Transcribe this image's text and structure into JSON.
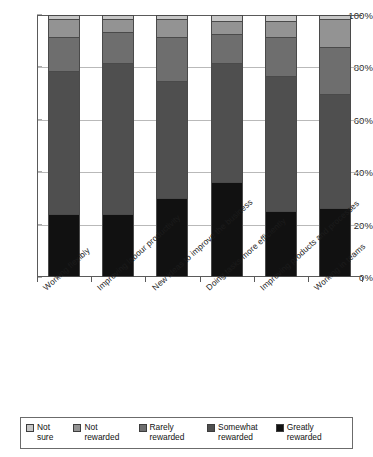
{
  "chart_data": {
    "type": "bar",
    "variant": "100% stacked column",
    "title": "",
    "subtitle": "",
    "xlabel": "",
    "ylabel": "",
    "ylim": [
      0,
      100
    ],
    "ytick_labels": [
      "0%",
      "20%",
      "40%",
      "60%",
      "80%",
      "100%"
    ],
    "ytick_values": [
      0,
      20,
      40,
      60,
      80,
      100
    ],
    "grid": true,
    "grid_axis": "y",
    "legend_position": "bottom",
    "categories": [
      "Working flexibly",
      "Improving labour productivity",
      "New ideas to improve the business",
      "Doing tasks more efficiently",
      "Improving products and processes",
      "Working in teams"
    ],
    "series": [
      {
        "name": "Greatly rewarded",
        "color": "#111111",
        "values": [
          24,
          24,
          30,
          36,
          25,
          26
        ]
      },
      {
        "name": "Somewhat rewarded",
        "color": "#4f4f4f",
        "values": [
          55,
          58,
          45,
          46,
          52,
          44
        ]
      },
      {
        "name": "Rarely rewarded",
        "color": "#6e6e6e",
        "values": [
          13,
          12,
          17,
          11,
          15,
          18
        ]
      },
      {
        "name": "Not rewarded",
        "color": "#939393",
        "values": [
          7,
          5,
          7,
          5,
          6,
          11
        ]
      },
      {
        "name": "Not sure",
        "color": "#c6c6c6",
        "values": [
          1,
          1,
          1,
          2,
          2,
          1
        ]
      }
    ]
  },
  "legend": {
    "items": [
      {
        "label": "Not sure",
        "color": "#c6c6c6"
      },
      {
        "label": "Not rewarded",
        "color": "#939393"
      },
      {
        "label": "Rarely rewarded",
        "color": "#6e6e6e"
      },
      {
        "label": "Somewhat rewarded",
        "color": "#4f4f4f"
      },
      {
        "label": "Greatly rewarded",
        "color": "#111111"
      }
    ]
  },
  "axis": {
    "y_ticks": [
      "100%",
      "80%",
      "60%",
      "40%",
      "20%",
      "0%"
    ]
  }
}
